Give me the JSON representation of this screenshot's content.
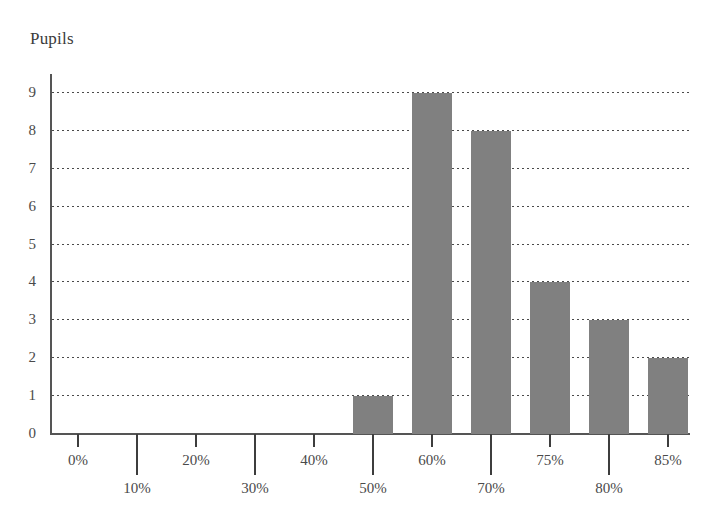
{
  "chart_data": {
    "type": "bar",
    "title": "",
    "subtitle": "",
    "ylabel": "Pupils",
    "xlabel": "",
    "categories": [
      "0%",
      "10%",
      "20%",
      "30%",
      "40%",
      "50%",
      "60%",
      "70%",
      "75%",
      "80%",
      "85%"
    ],
    "values": [
      0,
      0,
      0,
      0,
      0,
      1,
      9,
      8,
      4,
      3,
      2
    ],
    "yticks": [
      "0",
      "1",
      "2",
      "3",
      "4",
      "5",
      "6",
      "7",
      "8",
      "9"
    ],
    "ylim": [
      0,
      9
    ],
    "grid": "horizontal-dotted",
    "legend": "none",
    "bar_color": "#808080",
    "axis_color": "#555555",
    "text_color": "#4a4a4a",
    "annotations": []
  },
  "axis": {
    "y_caption": "Pupils"
  }
}
